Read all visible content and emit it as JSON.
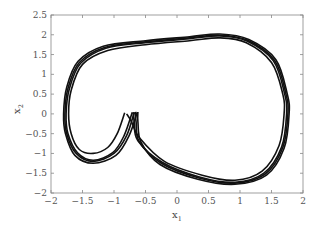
{
  "chart_data": {
    "type": "line",
    "title": "",
    "xlabel": "x1",
    "ylabel": "x2",
    "xlabel_main": "x",
    "xlabel_sub": "1",
    "ylabel_main": "x",
    "ylabel_sub": "2",
    "xlim": [
      -2,
      2
    ],
    "ylim": [
      -2,
      2.5
    ],
    "xticks": [
      -2,
      -1.5,
      -1,
      -0.5,
      0,
      0.5,
      1,
      1.5,
      2
    ],
    "xtick_labels": [
      "−2",
      "−1.5",
      "−1",
      "−0.5",
      "0",
      "0.5",
      "1",
      "1.5",
      "2"
    ],
    "yticks": [
      -2,
      -1.5,
      -1,
      -0.5,
      0,
      0.5,
      1,
      1.5,
      2,
      2.5
    ],
    "ytick_labels": [
      "−2",
      "−1.5",
      "−1",
      "−0.5",
      "0",
      "0.5",
      "1",
      "1.5",
      "2",
      "2.5"
    ],
    "grid": false,
    "legend": null,
    "line_color": "#111111",
    "series": [
      {
        "name": "trajectory-inner-cusp",
        "points": [
          [
            -0.83,
            0.03
          ],
          [
            -0.95,
            -0.5
          ],
          [
            -1.1,
            -0.85
          ],
          [
            -1.33,
            -1.0
          ],
          [
            -1.55,
            -0.9
          ],
          [
            -1.68,
            -0.5
          ],
          [
            -1.72,
            0.0
          ],
          [
            -1.68,
            0.6
          ],
          [
            -1.5,
            1.25
          ],
          [
            -1.1,
            1.6
          ],
          [
            -0.5,
            1.75
          ],
          [
            0.2,
            1.85
          ],
          [
            0.68,
            1.92
          ],
          [
            1.1,
            1.8
          ],
          [
            1.5,
            1.3
          ],
          [
            1.68,
            0.5
          ],
          [
            1.7,
            0.0
          ],
          [
            1.62,
            -0.8
          ],
          [
            1.35,
            -1.45
          ],
          [
            0.92,
            -1.68
          ],
          [
            0.4,
            -1.55
          ],
          [
            -0.2,
            -1.2
          ],
          [
            -0.6,
            -0.6
          ],
          [
            -0.72,
            -0.2
          ],
          [
            -0.8,
            0.0
          ]
        ]
      },
      {
        "name": "trajectory-outer-cusp-1",
        "points": [
          [
            -0.68,
            0.04
          ],
          [
            -0.8,
            -0.55
          ],
          [
            -1.0,
            -1.0
          ],
          [
            -1.33,
            -1.2
          ],
          [
            -1.6,
            -1.0
          ],
          [
            -1.75,
            -0.5
          ],
          [
            -1.78,
            0.0
          ],
          [
            -1.73,
            0.65
          ],
          [
            -1.55,
            1.3
          ],
          [
            -1.15,
            1.68
          ],
          [
            -0.5,
            1.82
          ],
          [
            0.2,
            1.92
          ],
          [
            0.68,
            1.99
          ],
          [
            1.12,
            1.86
          ],
          [
            1.55,
            1.35
          ],
          [
            1.73,
            0.5
          ],
          [
            1.76,
            0.0
          ],
          [
            1.68,
            -0.85
          ],
          [
            1.4,
            -1.52
          ],
          [
            0.92,
            -1.75
          ],
          [
            0.35,
            -1.62
          ],
          [
            -0.25,
            -1.25
          ],
          [
            -0.6,
            -0.7
          ],
          [
            -0.65,
            -0.2
          ],
          [
            -0.66,
            0.05
          ]
        ]
      },
      {
        "name": "trajectory-outer-cusp-2",
        "points": [
          [
            -0.63,
            0.05
          ],
          [
            -0.76,
            -0.55
          ],
          [
            -0.97,
            -1.05
          ],
          [
            -1.33,
            -1.25
          ],
          [
            -1.62,
            -1.05
          ],
          [
            -1.77,
            -0.5
          ],
          [
            -1.8,
            0.0
          ],
          [
            -1.75,
            0.68
          ],
          [
            -1.57,
            1.33
          ],
          [
            -1.17,
            1.71
          ],
          [
            -0.5,
            1.85
          ],
          [
            0.2,
            1.95
          ],
          [
            0.68,
            2.02
          ],
          [
            1.14,
            1.88
          ],
          [
            1.57,
            1.37
          ],
          [
            1.75,
            0.5
          ],
          [
            1.78,
            0.0
          ],
          [
            1.7,
            -0.87
          ],
          [
            1.42,
            -1.55
          ],
          [
            0.92,
            -1.78
          ],
          [
            0.33,
            -1.65
          ],
          [
            -0.27,
            -1.28
          ],
          [
            -0.57,
            -0.72
          ],
          [
            -0.62,
            -0.2
          ],
          [
            -0.62,
            0.05
          ]
        ]
      },
      {
        "name": "trajectory-outer-cusp-3",
        "points": [
          [
            -0.71,
            0.04
          ],
          [
            -0.84,
            -0.55
          ],
          [
            -1.02,
            -0.98
          ],
          [
            -1.33,
            -1.17
          ],
          [
            -1.58,
            -0.98
          ],
          [
            -1.73,
            -0.5
          ],
          [
            -1.76,
            0.0
          ],
          [
            -1.71,
            0.63
          ],
          [
            -1.53,
            1.28
          ],
          [
            -1.13,
            1.66
          ],
          [
            -0.5,
            1.8
          ],
          [
            0.2,
            1.9
          ],
          [
            0.68,
            1.97
          ],
          [
            1.11,
            1.84
          ],
          [
            1.53,
            1.34
          ],
          [
            1.71,
            0.5
          ],
          [
            1.74,
            0.0
          ],
          [
            1.66,
            -0.84
          ],
          [
            1.38,
            -1.5
          ],
          [
            0.92,
            -1.73
          ],
          [
            0.37,
            -1.6
          ],
          [
            -0.23,
            -1.23
          ],
          [
            -0.62,
            -0.68
          ],
          [
            -0.68,
            -0.2
          ],
          [
            -0.69,
            0.04
          ]
        ]
      }
    ]
  }
}
